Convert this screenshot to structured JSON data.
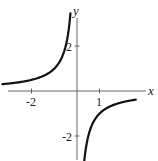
{
  "chart_data": {
    "type": "line",
    "title": "",
    "function": "y = -1/x",
    "xlabel": "x",
    "ylabel": "y",
    "xlim": [
      -3.4,
      2.6
    ],
    "ylim": [
      -3.1,
      3.5
    ],
    "x_ticks": [
      {
        "value": -2,
        "label": "-2"
      },
      {
        "value": 1,
        "label": "1"
      }
    ],
    "y_ticks": [
      {
        "value": 2,
        "label": "2"
      },
      {
        "value": -2,
        "label": "-2"
      }
    ],
    "grid": false,
    "legend": null,
    "series": [
      {
        "name": "left-branch",
        "x": [
          -3.3,
          -3,
          -2.5,
          -2,
          -1.5,
          -1,
          -0.75,
          -0.5,
          -0.4,
          -0.33,
          -0.29
        ],
        "y": [
          0.3,
          0.33,
          0.4,
          0.5,
          0.67,
          1.0,
          1.33,
          2.0,
          2.5,
          3.0,
          3.45
        ]
      },
      {
        "name": "right-branch",
        "x": [
          0.3,
          0.33,
          0.4,
          0.5,
          0.75,
          1,
          1.5,
          2,
          2.5,
          2.6
        ],
        "y": [
          -3.33,
          -3.0,
          -2.5,
          -2.0,
          -1.33,
          -1.0,
          -0.67,
          -0.5,
          -0.4,
          -0.38
        ]
      }
    ]
  },
  "axes": {
    "x_label": "x",
    "y_label": "y",
    "x_tick_labels": [
      "-2",
      "1"
    ],
    "y_tick_labels": [
      "2",
      "-2"
    ]
  }
}
